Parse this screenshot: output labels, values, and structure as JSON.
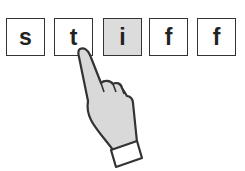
{
  "tiles": [
    {
      "letter": "s",
      "highlighted": false
    },
    {
      "letter": "t",
      "highlighted": false
    },
    {
      "letter": "i",
      "highlighted": true
    },
    {
      "letter": "f",
      "highlighted": false
    },
    {
      "letter": "f",
      "highlighted": false
    }
  ],
  "pointer": {
    "icon": "pointing-hand-icon",
    "target_index": 1
  },
  "colors": {
    "highlight": "#dcdcdc",
    "hand_fill": "#d9d9d9",
    "stroke": "#333333"
  }
}
